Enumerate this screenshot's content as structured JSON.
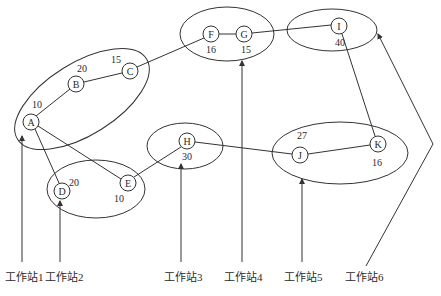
{
  "diagram": {
    "type": "graph-partition",
    "colors": {
      "stroke": "#333333",
      "text": "#2a2a2a",
      "background": "#ffffff"
    },
    "nodes": [
      {
        "id": "A",
        "label": "A",
        "weight": "10",
        "x": 31,
        "y": 122
      },
      {
        "id": "B",
        "label": "B",
        "weight": "20",
        "x": 76,
        "y": 84
      },
      {
        "id": "C",
        "label": "C",
        "weight": "15",
        "x": 130,
        "y": 71
      },
      {
        "id": "D",
        "label": "D",
        "weight": "20",
        "x": 62,
        "y": 191
      },
      {
        "id": "E",
        "label": "E",
        "weight": "10",
        "x": 128,
        "y": 183
      },
      {
        "id": "F",
        "label": "F",
        "weight": "16",
        "x": 211,
        "y": 34
      },
      {
        "id": "G",
        "label": "G",
        "weight": "15",
        "x": 244,
        "y": 34
      },
      {
        "id": "H",
        "label": "H",
        "weight": "30",
        "x": 187,
        "y": 141
      },
      {
        "id": "I",
        "label": "I",
        "weight": "40",
        "x": 339,
        "y": 26
      },
      {
        "id": "J",
        "label": "J",
        "weight": "27",
        "x": 300,
        "y": 155
      },
      {
        "id": "K",
        "label": "K",
        "weight": "16",
        "x": 378,
        "y": 144
      }
    ],
    "edges": [
      [
        "A",
        "B"
      ],
      [
        "B",
        "C"
      ],
      [
        "C",
        "F"
      ],
      [
        "F",
        "G"
      ],
      [
        "G",
        "I"
      ],
      [
        "A",
        "D"
      ],
      [
        "A",
        "E"
      ],
      [
        "E",
        "H"
      ],
      [
        "H",
        "J"
      ],
      [
        "J",
        "K"
      ],
      [
        "I",
        "K"
      ]
    ],
    "groups": [
      {
        "station": "工作站1",
        "members": [
          "A",
          "B",
          "C"
        ]
      },
      {
        "station": "工作站2",
        "members": [
          "D",
          "E"
        ]
      },
      {
        "station": "工作站3",
        "members": [
          "H"
        ]
      },
      {
        "station": "工作站4",
        "members": [
          "F",
          "G"
        ]
      },
      {
        "station": "工作站5",
        "members": [
          "J",
          "K"
        ]
      },
      {
        "station": "工作站6",
        "members": [
          "I"
        ]
      }
    ],
    "stations": [
      {
        "label": "工作站1"
      },
      {
        "label": "工作站2"
      },
      {
        "label": "工作站3"
      },
      {
        "label": "工作站4"
      },
      {
        "label": "工作站5"
      },
      {
        "label": "工作站6"
      }
    ]
  }
}
